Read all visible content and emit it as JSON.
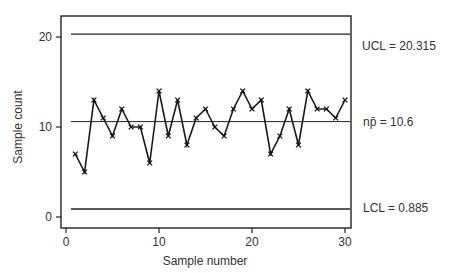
{
  "chart_data": {
    "type": "line",
    "title": "",
    "xlabel": "Sample number",
    "ylabel": "Sample count",
    "x": [
      1,
      2,
      3,
      4,
      5,
      6,
      7,
      8,
      9,
      10,
      11,
      12,
      13,
      14,
      15,
      16,
      17,
      18,
      19,
      20,
      21,
      22,
      23,
      24,
      25,
      26,
      27,
      28,
      29,
      30
    ],
    "series": [
      {
        "name": "Sample count",
        "marker": "x",
        "values": [
          7,
          5,
          13,
          11,
          9,
          12,
          10,
          10,
          6,
          14,
          9,
          13,
          8,
          11,
          12,
          10,
          9,
          12,
          14,
          12,
          13,
          7,
          9,
          12,
          8,
          14,
          12,
          12,
          11,
          13
        ]
      }
    ],
    "reference_lines": [
      {
        "name": "UCL",
        "value": 20.315,
        "label": "UCL = 20.315"
      },
      {
        "name": "center",
        "value": 10.6,
        "label": "np̄ = 10.6"
      },
      {
        "name": "LCL",
        "value": 0.885,
        "label": "LCL = 0.885"
      }
    ],
    "xticks": [
      0,
      10,
      20,
      30
    ],
    "yticks": [
      0,
      10,
      20
    ],
    "xlim": [
      0,
      31
    ],
    "ylim": [
      -1,
      23
    ],
    "grid": false,
    "legend": "none"
  },
  "labels": {
    "xlabel": "Sample number",
    "ylabel": "Sample count",
    "ucl": "UCL = 20.315",
    "center": "np̄ = 10.6",
    "lcl": "LCL = 0.885"
  }
}
